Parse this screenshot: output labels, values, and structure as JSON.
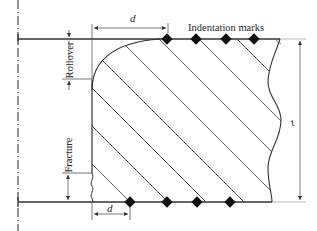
{
  "diagram": {
    "labels": {
      "indentation_marks": "Indentation marks",
      "rollover": "Rollover",
      "fracture": "Fracture",
      "d_top": "d",
      "d_bottom": "d",
      "thickness": "t"
    },
    "colors": {
      "line": "#333333",
      "thin_line": "#555555",
      "hatch": "#444444",
      "marker": "#111111",
      "centerline": "#444444",
      "extension": "#aaaaaa"
    },
    "geometry": {
      "top_y": 39,
      "bottom_y": 202,
      "left_edge_x": 92,
      "centerline_x": 18,
      "rollover_end_y": 79,
      "fracture_start_y": 173,
      "hatch_angle_deg": 45,
      "hatch_offsets": [
        -72,
        -34,
        4,
        42,
        80,
        120,
        160,
        198
      ]
    },
    "markers": {
      "top_x": [
        167,
        196,
        226,
        254
      ],
      "bottom_x": [
        130,
        167,
        197,
        230
      ]
    }
  }
}
